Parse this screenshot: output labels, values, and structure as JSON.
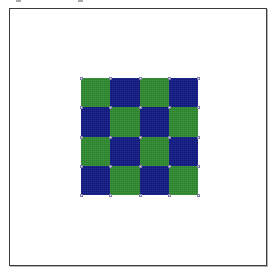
{
  "canvas": {
    "name": "drawing-canvas",
    "background_color": "#ffffff",
    "border_color": "#3b3b3b"
  },
  "top_fragments": [
    {
      "name": "clipped-glyph-fragment-left"
    },
    {
      "name": "clipped-glyph-fragment-right"
    }
  ],
  "checkerboard": {
    "name": "checkerboard-pattern",
    "rows": 4,
    "columns": 4,
    "colors": {
      "green": "#2f8a30",
      "blue": "#121a84"
    },
    "grid": [
      [
        "green",
        "blue",
        "green",
        "blue"
      ],
      [
        "blue",
        "green",
        "blue",
        "green"
      ],
      [
        "green",
        "blue",
        "green",
        "blue"
      ],
      [
        "blue",
        "green",
        "blue",
        "green"
      ]
    ]
  },
  "handles": {
    "name": "selection-handles",
    "color": "#f2f2f2",
    "border_color": "#7e7ea8",
    "count": 25
  }
}
